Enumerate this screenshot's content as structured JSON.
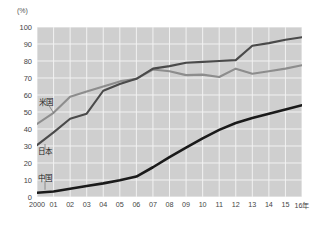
{
  "chart_data": {
    "type": "line",
    "title": "",
    "subtitle": "",
    "xlabel": "",
    "ylabel": "(%)",
    "unit_label": "(%)",
    "x": [
      2000,
      2001,
      2002,
      2003,
      2004,
      2005,
      2006,
      2007,
      2008,
      2009,
      2010,
      2011,
      2012,
      2013,
      2014,
      2015,
      2016
    ],
    "categories": [
      "2000",
      "01",
      "02",
      "03",
      "04",
      "05",
      "06",
      "07",
      "08",
      "09",
      "10",
      "11",
      "12",
      "13",
      "14",
      "15",
      "16年"
    ],
    "ylim": [
      0,
      100
    ],
    "xlim": [
      2000,
      2016
    ],
    "y_ticks": [
      "0",
      "10",
      "20",
      "30",
      "40",
      "50",
      "60",
      "70",
      "80",
      "90",
      "100"
    ],
    "grid": true,
    "legend_position": "inline-annotations",
    "series": [
      {
        "name": "米国",
        "name_en": "United States",
        "color": "#8d8d8d",
        "values": [
          43,
          49.5,
          59,
          62,
          65,
          68,
          69.5,
          75,
          74,
          71.7,
          72,
          70.6,
          75.5,
          72.5,
          74,
          75.5,
          77.5
        ]
      },
      {
        "name": "日本",
        "name_en": "Japan",
        "color": "#4a4a4a",
        "values": [
          30.5,
          38,
          46,
          49,
          62.5,
          66.5,
          69.5,
          75.5,
          77,
          79,
          79.5,
          80,
          80.5,
          89,
          90.5,
          92.5,
          94
        ]
      },
      {
        "name": "中国",
        "name_en": "China",
        "color": "#1a1a1a",
        "values": [
          2.5,
          3.2,
          4.8,
          6.5,
          8,
          9.8,
          12,
          17.5,
          23.5,
          29,
          34.5,
          39.5,
          43.5,
          46.5,
          49,
          51.5,
          54
        ]
      }
    ],
    "annotations": [
      {
        "label": "米国",
        "series": "米国",
        "points_to_year": 2001
      },
      {
        "label": "日本",
        "series": "日本",
        "points_to_year": 2000
      },
      {
        "label": "中国",
        "series": "中国",
        "points_to_year": 2000
      }
    ]
  }
}
